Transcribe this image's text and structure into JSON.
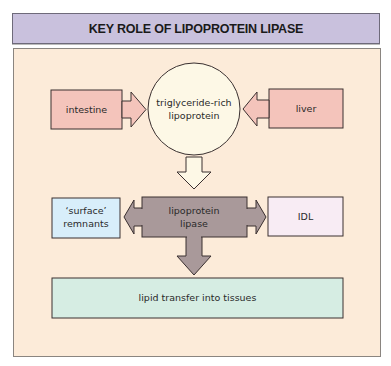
{
  "title": "KEY ROLE OF LIPOPROTEIN LIPASE",
  "nodes": {
    "intestine": "intestine",
    "liver": "liver",
    "trl_line1": "triglyceride-rich",
    "trl_line2": "lipoprotein",
    "lpl_line1": "lipoprotein",
    "lpl_line2": "lipase",
    "surface_line1": "‘surface’",
    "surface_line2": "remnants",
    "idl": "IDL",
    "lipid_transfer": "lipid transfer into tissues"
  },
  "colors": {
    "header_bg": "#c9c1dd",
    "panel_bg": "#fcebd9",
    "source_box": "#f4c4bb",
    "circle": "#fdf8e6",
    "lpl_box": "#a9999a",
    "surface_box": "#d8eefa",
    "idl_box": "#f8ecf4",
    "lipid_box": "#d6ede3"
  },
  "edges": [
    {
      "from": "intestine",
      "to": "triglyceride-rich lipoprotein"
    },
    {
      "from": "liver",
      "to": "triglyceride-rich lipoprotein"
    },
    {
      "from": "triglyceride-rich lipoprotein",
      "to": "lipoprotein lipase"
    },
    {
      "from": "lipoprotein lipase",
      "to": "surface remnants"
    },
    {
      "from": "lipoprotein lipase",
      "to": "IDL"
    },
    {
      "from": "lipoprotein lipase",
      "to": "lipid transfer into tissues"
    }
  ]
}
